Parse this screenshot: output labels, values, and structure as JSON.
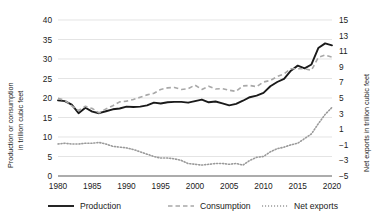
{
  "chart_data": {
    "type": "line",
    "title": "",
    "xlabel": "",
    "ylabel": "Production or consumption in trillion cubic feet",
    "y2label": "Net exports in trillion cubic feet",
    "grid": true,
    "legend_position": "bottom",
    "xlim": [
      1980,
      2020
    ],
    "ylim": [
      0,
      40
    ],
    "y2lim": [
      -5,
      15
    ],
    "xticks": [
      "1980",
      "1985",
      "1990",
      "1995",
      "2000",
      "2005",
      "2010",
      "2015",
      "2020"
    ],
    "yticks": [
      "0",
      "5",
      "10",
      "15",
      "20",
      "25",
      "30",
      "35",
      "40"
    ],
    "y2ticks": [
      "-5",
      "-3",
      "-1",
      "1",
      "3",
      "5",
      "7",
      "9",
      "11",
      "13",
      "15"
    ],
    "x": [
      1980,
      1981,
      1982,
      1983,
      1984,
      1985,
      1986,
      1987,
      1988,
      1989,
      1990,
      1991,
      1992,
      1993,
      1994,
      1995,
      1996,
      1997,
      1998,
      1999,
      2000,
      2001,
      2002,
      2003,
      2004,
      2005,
      2006,
      2007,
      2008,
      2009,
      2010,
      2011,
      2012,
      2013,
      2014,
      2015,
      2016,
      2017,
      2018,
      2019,
      2020
    ],
    "series": [
      {
        "name": "Production",
        "axis": "left",
        "style": "solid",
        "color": "#1a1a1a",
        "values": [
          19.4,
          19.2,
          18.3,
          16.1,
          17.5,
          16.5,
          16.1,
          16.6,
          17.1,
          17.3,
          17.8,
          17.7,
          17.8,
          18.1,
          18.8,
          18.6,
          18.9,
          19.0,
          19.0,
          18.8,
          19.2,
          19.6,
          18.9,
          19.1,
          18.6,
          18.1,
          18.5,
          19.3,
          20.2,
          20.6,
          21.3,
          23.0,
          24.1,
          24.9,
          27.0,
          28.3,
          27.6,
          28.6,
          32.8,
          34.0,
          33.5
        ]
      },
      {
        "name": "Consumption",
        "axis": "left",
        "style": "dashed",
        "color": "#a8a8a8",
        "values": [
          19.9,
          19.4,
          18.0,
          16.8,
          17.9,
          17.3,
          16.2,
          17.2,
          18.0,
          19.0,
          19.2,
          19.6,
          20.2,
          20.8,
          21.2,
          22.2,
          22.6,
          22.7,
          22.2,
          22.4,
          23.3,
          22.2,
          23.0,
          22.3,
          22.4,
          22.0,
          21.7,
          23.1,
          23.2,
          22.9,
          24.1,
          24.5,
          25.5,
          26.2,
          27.5,
          27.5,
          27.5,
          27.1,
          30.4,
          31.0,
          30.5
        ]
      },
      {
        "name": "Net exports",
        "axis": "right",
        "style": "dotted",
        "color": "#9a9a9a",
        "values": [
          -0.9,
          -0.8,
          -0.9,
          -0.9,
          -0.8,
          -0.8,
          -0.7,
          -0.9,
          -1.2,
          -1.3,
          -1.4,
          -1.6,
          -1.9,
          -2.2,
          -2.5,
          -2.7,
          -2.7,
          -2.8,
          -3.0,
          -3.4,
          -3.5,
          -3.6,
          -3.5,
          -3.4,
          -3.4,
          -3.5,
          -3.4,
          -3.6,
          -3.0,
          -2.6,
          -2.5,
          -1.9,
          -1.5,
          -1.3,
          -1.0,
          -0.8,
          -0.2,
          0.4,
          1.7,
          2.9,
          3.8
        ]
      }
    ],
    "legend": [
      {
        "label": "Production",
        "style": "solid",
        "color": "#1a1a1a"
      },
      {
        "label": "Consumption",
        "style": "dashed",
        "color": "#a8a8a8"
      },
      {
        "label": "Net exports",
        "style": "dotted",
        "color": "#9a9a9a"
      }
    ]
  }
}
